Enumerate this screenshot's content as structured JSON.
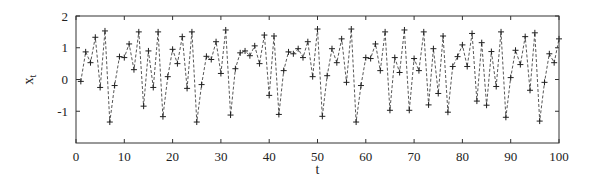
{
  "chart_data": {
    "type": "line",
    "title": "",
    "xlabel": "t",
    "ylabel": "x_t",
    "ylabel_main": "x",
    "ylabel_sub": "t",
    "xlim": [
      0,
      100
    ],
    "ylim": [
      -2,
      2
    ],
    "xticks": [
      0,
      10,
      20,
      30,
      40,
      50,
      60,
      70,
      80,
      90,
      100
    ],
    "yticks": [
      -1,
      0,
      1,
      2
    ],
    "ytick_labels": [
      "-1",
      "0",
      "1",
      "2"
    ],
    "grid": false,
    "legend": null,
    "line_style": "dashed",
    "marker": "+",
    "series": [
      {
        "name": "x_t",
        "x": [
          1,
          2,
          3,
          4,
          5,
          6,
          7,
          8,
          9,
          10,
          11,
          12,
          13,
          14,
          15,
          16,
          17,
          18,
          19,
          20,
          21,
          22,
          23,
          24,
          25,
          26,
          27,
          28,
          29,
          30,
          31,
          32,
          33,
          34,
          35,
          36,
          37,
          38,
          39,
          40,
          41,
          42,
          43,
          44,
          45,
          46,
          47,
          48,
          49,
          50,
          51,
          52,
          53,
          54,
          55,
          56,
          57,
          58,
          59,
          60,
          61,
          62,
          63,
          64,
          65,
          66,
          67,
          68,
          69,
          70,
          71,
          72,
          73,
          74,
          75,
          76,
          77,
          78,
          79,
          80,
          81,
          82,
          83,
          84,
          85,
          86,
          87,
          88,
          89,
          90,
          91,
          92,
          93,
          94,
          95,
          96,
          97,
          98,
          99,
          100
        ],
        "values": [
          -0.06,
          0.87,
          0.53,
          1.33,
          -0.25,
          1.53,
          -1.34,
          -0.19,
          0.72,
          0.69,
          1.12,
          0.31,
          1.5,
          -0.84,
          0.9,
          -0.25,
          1.5,
          -1.17,
          0.09,
          0.95,
          0.5,
          1.35,
          -0.28,
          1.5,
          -1.34,
          -0.16,
          0.73,
          0.63,
          1.19,
          0.19,
          1.56,
          -1.12,
          0.34,
          0.84,
          0.9,
          0.75,
          1.06,
          0.5,
          1.4,
          -0.5,
          1.37,
          -1.1,
          0.28,
          0.87,
          0.81,
          0.97,
          0.69,
          1.19,
          0.09,
          1.59,
          -1.16,
          0.12,
          0.97,
          0.53,
          1.28,
          -0.09,
          1.59,
          -1.34,
          -0.19,
          0.69,
          0.66,
          1.12,
          0.28,
          1.5,
          -0.97,
          0.69,
          0.22,
          1.56,
          -0.97,
          0.66,
          0.28,
          1.5,
          -0.8,
          0.97,
          -0.44,
          1.37,
          -1.03,
          0.41,
          0.72,
          1.09,
          0.41,
          1.45,
          -0.68,
          1.16,
          -0.81,
          0.88,
          -0.22,
          1.5,
          -1.19,
          0.06,
          0.92,
          0.47,
          1.35,
          -0.34,
          1.47,
          -1.31,
          -0.09,
          0.81,
          0.53,
          1.28
        ]
      }
    ]
  },
  "layout": {
    "plot_left": 76,
    "plot_right": 559,
    "plot_top": 16,
    "plot_bottom": 143
  }
}
